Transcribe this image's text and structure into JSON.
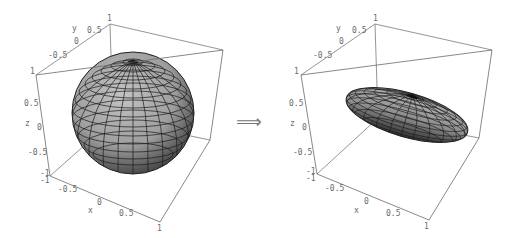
{
  "figure": {
    "arrow": "⟹",
    "panels": [
      {
        "name": "sphere",
        "shape": "sphere",
        "axes": {
          "x": {
            "label": "x",
            "ticks": [
              "-1",
              "-0.5",
              "0",
              "0.5",
              "1"
            ]
          },
          "y": {
            "label": "y",
            "ticks": [
              "-1",
              "-0.5",
              "0",
              "0.5",
              "1"
            ]
          },
          "z": {
            "label": "z",
            "ticks": [
              "-1",
              "-0.5",
              "0",
              "0.5",
              "1"
            ]
          }
        }
      },
      {
        "name": "ellipsoid",
        "shape": "flattened tilted ellipsoid",
        "axes": {
          "x": {
            "label": "x",
            "ticks": [
              "-1",
              "-0.5",
              "0",
              "0.5",
              "1"
            ]
          },
          "y": {
            "label": "y",
            "ticks": [
              "-1",
              "-0.5",
              "0",
              "0.5",
              "1"
            ]
          },
          "z": {
            "label": "z",
            "ticks": [
              "-1",
              "-0.5",
              "0",
              "0.5",
              "1"
            ]
          }
        }
      }
    ],
    "colors": {
      "box": "#707070",
      "surface": "#a8a8a8",
      "mesh": "#1a1a1a",
      "label": "#6a6a6a"
    }
  },
  "labels": {
    "p1": {
      "y_axis": "y",
      "y_05": "0.5",
      "y_0": "0",
      "y_m05": "-0.5",
      "y_1": "1",
      "z_1": "1",
      "z_05": "0.5",
      "z_axis": "z",
      "z_0": "0",
      "z_m05": "-0.5",
      "z_m1": "-1",
      "x_m1": "-1",
      "x_m05": "-0.5",
      "x_0": "0",
      "x_axis": "x",
      "x_05": "0.5",
      "x_1": "1",
      "corner": "1"
    },
    "p2": {
      "y_axis": "y",
      "y_05": "0.5",
      "y_0": "0",
      "y_m05": "-0.5",
      "y_1": "1",
      "z_1": "1",
      "z_05": "0.5",
      "z_axis": "z",
      "z_0": "0",
      "z_m05": "-0.5",
      "z_m1": "-1",
      "x_m1": "-1",
      "x_m05": "-0.5",
      "x_0": "0",
      "x_axis": "x",
      "x_05": "0.5",
      "x_1": "1",
      "corner": "1"
    }
  }
}
